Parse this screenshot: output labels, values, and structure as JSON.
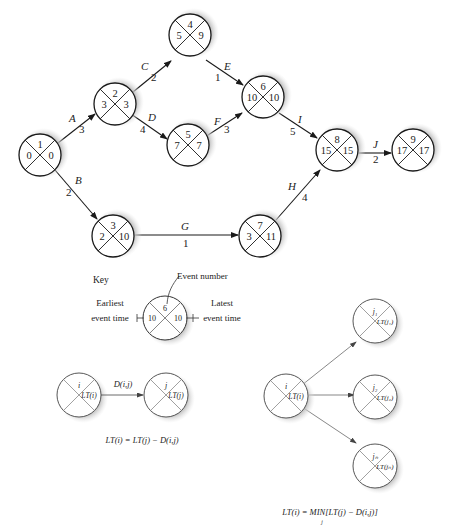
{
  "network": {
    "nodes": [
      {
        "id": "1",
        "event": "1",
        "early": "0",
        "late": "0",
        "cx": 40,
        "cy": 155
      },
      {
        "id": "2",
        "event": "2",
        "early": "3",
        "late": "3",
        "cx": 115,
        "cy": 104
      },
      {
        "id": "4",
        "event": "4",
        "early": "5",
        "late": "9",
        "cx": 190,
        "cy": 35
      },
      {
        "id": "5",
        "event": "5",
        "early": "7",
        "late": "7",
        "cx": 188,
        "cy": 145
      },
      {
        "id": "6",
        "event": "6",
        "early": "10",
        "late": "10",
        "cx": 263,
        "cy": 97
      },
      {
        "id": "8",
        "event": "8",
        "early": "15",
        "late": "15",
        "cx": 337,
        "cy": 150
      },
      {
        "id": "9",
        "event": "9",
        "early": "17",
        "late": "17",
        "cx": 413,
        "cy": 150
      },
      {
        "id": "3",
        "event": "3",
        "early": "2",
        "late": "10",
        "cx": 113,
        "cy": 236
      },
      {
        "id": "7",
        "event": "7",
        "early": "3",
        "late": "11",
        "cx": 260,
        "cy": 236
      }
    ],
    "activities": [
      {
        "name": "A",
        "duration": "3"
      },
      {
        "name": "B",
        "duration": "2"
      },
      {
        "name": "C",
        "duration": "2"
      },
      {
        "name": "D",
        "duration": "4"
      },
      {
        "name": "E",
        "duration": "1"
      },
      {
        "name": "F",
        "duration": "3"
      },
      {
        "name": "G",
        "duration": "1"
      },
      {
        "name": "H",
        "duration": "4"
      },
      {
        "name": "I",
        "duration": "5"
      },
      {
        "name": "J",
        "duration": "2"
      }
    ]
  },
  "key": {
    "title": "Key",
    "event_number_label": "Event number",
    "earliest_label_1": "Earliest",
    "earliest_label_2": "event time",
    "latest_label_1": "Latest",
    "latest_label_2": "event time",
    "event": "6",
    "early": "10",
    "late": "10"
  },
  "single_rule": {
    "node_i": "i",
    "node_i_lt": "LT(i)",
    "node_j": "j",
    "node_j_lt": "LT(j)",
    "arc_label": "D(i,j)",
    "formula": "LT(i) = LT(j) − D(i,j)"
  },
  "multi_rule": {
    "node_i": "i",
    "node_i_lt": "LT(i)",
    "targets": [
      {
        "label": "j₁",
        "lt": "LT(j₁)"
      },
      {
        "label": "j₂",
        "lt": "LT(j₂)"
      },
      {
        "label": "jₙ",
        "lt": "LT(jₙ)"
      }
    ],
    "formula": "LT(i) = MIN[LT(j) − D(i,j)]",
    "formula_sub": "j"
  },
  "colors": {
    "stroke": "#1a1a1a",
    "shadow": "#c8c8c8",
    "thin_stroke": "#555555"
  }
}
